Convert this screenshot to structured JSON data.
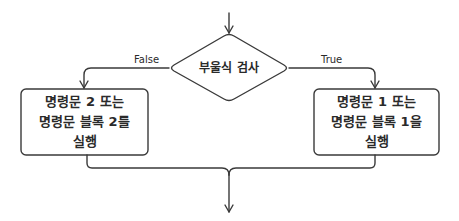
{
  "diagram": {
    "type": "flowchart",
    "decision": {
      "label": "부울식 검사"
    },
    "branches": {
      "false_label": "False",
      "true_label": "True"
    },
    "false_block": {
      "lines": [
        "명령문 2 또는",
        "명령문 블록 2를",
        "실행"
      ]
    },
    "true_block": {
      "lines": [
        "명령문 1 또는",
        "명령문 블록 1을",
        "실행"
      ]
    },
    "colors": {
      "stroke": "#3a3a3a",
      "background": "#ffffff",
      "text": "#2a2a2a"
    }
  }
}
